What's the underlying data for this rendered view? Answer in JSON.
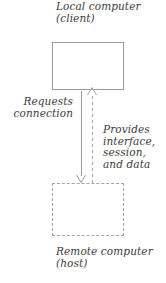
{
  "diagram": {
    "type": "client-server-connection-flow",
    "nodes": [
      {
        "id": "local-computer",
        "label": "Local computer\n(client)",
        "shape": "rectangle",
        "border_style": "solid",
        "border_color": "#9a9a9a",
        "fill": "none"
      },
      {
        "id": "remote-computer",
        "label": "Remote computer\n(host)",
        "shape": "rectangle",
        "border_style": "dashed",
        "border_color": "#a5a5a5",
        "fill": "none"
      }
    ],
    "edges": [
      {
        "id": "requests-connection",
        "label": "Requests\nconnection",
        "from": "local-computer",
        "to": "remote-computer",
        "line_style": "solid",
        "direction": "down",
        "color": "#9a9a9a"
      },
      {
        "id": "provides-services",
        "label": "Provides\ninterface,\nsession,\nand data",
        "from": "remote-computer",
        "to": "local-computer",
        "line_style": "dashed",
        "direction": "up",
        "color": "#a5a5a5"
      }
    ],
    "text_color": "#3c3c3c",
    "background": "#ffffff"
  }
}
